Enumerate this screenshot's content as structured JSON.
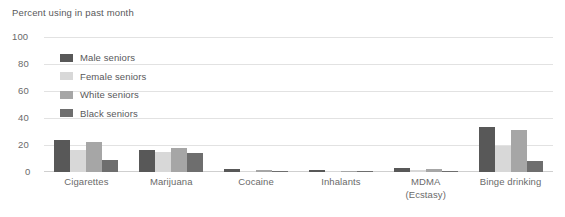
{
  "chart_data": {
    "type": "bar",
    "title": "Percent using in past month",
    "xlabel": "",
    "ylabel": "",
    "ylim": [
      0,
      100
    ],
    "yticks": [
      0,
      20,
      40,
      60,
      80,
      100
    ],
    "grid": true,
    "legend_position": "inside-upper-left",
    "categories": [
      "Cigarettes",
      "Marijuana",
      "Cocaine",
      "Inhalants",
      "MDMA (Ecstasy)",
      "Binge drinking"
    ],
    "category_lines": [
      [
        "Cigarettes"
      ],
      [
        "Marijuana"
      ],
      [
        "Cocaine"
      ],
      [
        "Inhalants"
      ],
      [
        "MDMA",
        "(Ecstasy)"
      ],
      [
        "Binge drinking"
      ]
    ],
    "series": [
      {
        "name": "Male seniors",
        "color": "#585858",
        "values": [
          24,
          16,
          2,
          1.5,
          3,
          33
        ]
      },
      {
        "name": "Female seniors",
        "color": "#d8d8d8",
        "values": [
          16,
          15,
          1,
          0.8,
          1.2,
          19
        ]
      },
      {
        "name": "White seniors",
        "color": "#a6a6a6",
        "values": [
          22,
          18,
          1.5,
          1,
          2,
          31
        ]
      },
      {
        "name": "Black seniors",
        "color": "#6e6e6e",
        "values": [
          9,
          14,
          1,
          1,
          0.8,
          8
        ]
      }
    ]
  },
  "axis": {
    "tick_labels": [
      "100",
      "80",
      "60",
      "40",
      "20",
      "0"
    ]
  }
}
